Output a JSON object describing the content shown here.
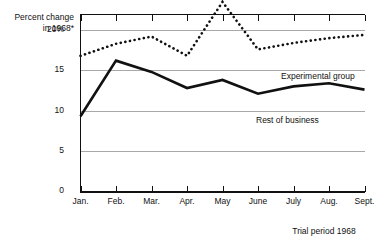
{
  "chart_data": {
    "type": "line",
    "title": "",
    "ylabel": "Percent change in 1968*",
    "xlabel": "Trial period 1968",
    "categories": [
      "Jan.",
      "Feb.",
      "Mar.",
      "Apr.",
      "May",
      "June",
      "July",
      "Aug.",
      "Sept."
    ],
    "ylim": [
      0,
      22
    ],
    "ytick_values": [
      0,
      5,
      10,
      15,
      20
    ],
    "ytick_labels": [
      "0",
      "5",
      "10",
      "15",
      "20%"
    ],
    "grid": true,
    "legend": "inline-labels",
    "series": [
      {
        "name": "Experimental group",
        "style": "dotted",
        "color": "#111111",
        "values": [
          16.8,
          18.3,
          19.2,
          16.8,
          23.5,
          17.6,
          18.4,
          19.0,
          19.4
        ]
      },
      {
        "name": "Rest of business",
        "style": "solid",
        "color": "#111111",
        "values": [
          9.3,
          16.2,
          14.8,
          12.8,
          13.8,
          12.1,
          13.0,
          13.4,
          12.6
        ]
      }
    ]
  },
  "axis": {
    "y_title_line1": "Percent change",
    "y_title_line2": "in 1968*",
    "x_caption": "Trial period 1968"
  },
  "labels": {
    "experimental": "Experimental group",
    "rest": "Rest of business"
  }
}
